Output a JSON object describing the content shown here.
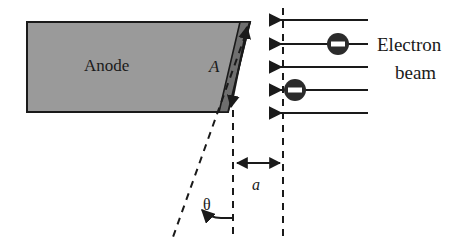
{
  "figure": {
    "background_color": "#ffffff",
    "width": 476,
    "height": 247
  },
  "anode": {
    "label": "Anode",
    "fill_color": "#9a9a9a",
    "edge_fill_color": "#6f6f6f",
    "outline_color": "#1a1a1a",
    "shape": "parallelogram",
    "top_left": [
      27,
      22
    ],
    "top_right": [
      250,
      22
    ],
    "bottom_right": [
      228,
      112
    ],
    "bottom_left": [
      27,
      112
    ]
  },
  "area_dimension": {
    "label": "A",
    "description": "double-headed arrow along the inclined anode face",
    "from": [
      232,
      108
    ],
    "to": [
      248,
      26
    ]
  },
  "gap_dimension": {
    "label": "a",
    "description": "horizontal double-headed arrow between the dashed reference lines",
    "from": [
      245,
      163
    ],
    "to": [
      283,
      163
    ],
    "label_position": [
      258,
      188
    ]
  },
  "angle": {
    "label": "θ",
    "description": "angle between the inclined dashed line and the vertical dashed line",
    "label_position": [
      210,
      208
    ],
    "arc_arrow": "curved arrow from vertical dashed line to inclined dashed line"
  },
  "dashed_lines": {
    "color": "#1a1a1a",
    "dash_pattern": "7 6",
    "inclined": {
      "from": [
        250,
        22
      ],
      "to": [
        173,
        237
      ]
    },
    "vertical_inner": {
      "from": [
        233,
        112
      ],
      "to": [
        233,
        237
      ]
    },
    "vertical_outer": {
      "from": [
        283,
        8
      ],
      "to": [
        283,
        237
      ]
    }
  },
  "electron_beam": {
    "label_line_1": "Electron",
    "label_line_2": "beam",
    "label_position": [
      372,
      48
    ],
    "arrow_color": "#1a1a1a",
    "direction": "right-to-left (arrowheads point left toward the anode)",
    "arrow_count": 5,
    "arrow_start_x": 368,
    "arrow_end_x": 268,
    "arrows": [
      {
        "y": 20,
        "electron": false
      },
      {
        "y": 44,
        "electron": true,
        "electron_x": 338
      },
      {
        "y": 67,
        "electron": false
      },
      {
        "y": 90,
        "electron": true,
        "electron_x": 295
      },
      {
        "y": 113,
        "electron": false
      }
    ]
  },
  "electron_marker": {
    "symbol": "−",
    "fill_color": "#2b2b2b",
    "sign_color": "#ffffff",
    "radius": 11,
    "description": "filled dark circle containing a white horizontal minus bar denoting negative charge"
  }
}
